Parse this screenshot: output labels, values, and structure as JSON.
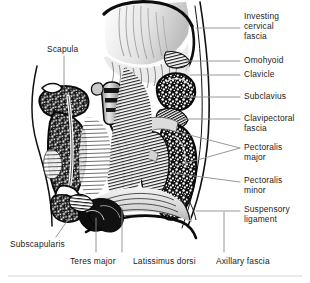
{
  "figure": {
    "title_alt": "Sagittal section of the shoulder region showing the clavipectoral fascia and axilla",
    "colors": {
      "ink": "#111111",
      "label_text": "#1b1b1b",
      "leader_line": "#8d8d8d",
      "outline": "#101010",
      "bone_fill": "#ffffff",
      "muscle_shade": "#d9d9d9",
      "deep_shade": "#4a4a4a",
      "footer_rule": "#d7d7d7",
      "background": "#ffffff"
    }
  },
  "labels": {
    "right_column": [
      {
        "id": "investing-cervical-fascia",
        "text": "Investing\ncervical\nfascia",
        "x": 244,
        "y": 11
      },
      {
        "id": "omohyoid",
        "text": "Omohyoid",
        "x": 244,
        "y": 55
      },
      {
        "id": "clavicle",
        "text": "Clavicle",
        "x": 244,
        "y": 69
      },
      {
        "id": "subclavius",
        "text": "Subclavius",
        "x": 244,
        "y": 91
      },
      {
        "id": "clavipectoral-fascia",
        "text": "Clavipectoral\nfascia",
        "x": 244,
        "y": 113
      },
      {
        "id": "pectoralis-major",
        "text": "Pectoralis\nmajor",
        "x": 244,
        "y": 142
      },
      {
        "id": "pectoralis-minor",
        "text": "Pectoralis\nminor",
        "x": 244,
        "y": 175
      },
      {
        "id": "suspensory-ligament",
        "text": "Suspensory\nligament",
        "x": 244,
        "y": 204
      }
    ],
    "left_column": [
      {
        "id": "scapula",
        "text": "Scapula",
        "x": 47,
        "y": 44
      },
      {
        "id": "subscapularis",
        "text": "Subscapularis",
        "x": 10,
        "y": 239
      }
    ],
    "bottom_row": [
      {
        "id": "teres-major",
        "text": "Teres major",
        "x": 70,
        "y": 256
      },
      {
        "id": "latissimus-dorsi",
        "text": "Latissimus dorsi",
        "x": 133,
        "y": 256
      },
      {
        "id": "axillary-fascia",
        "text": "Axillary fascia",
        "x": 216,
        "y": 256
      }
    ]
  },
  "leader_lines": [
    {
      "id": "leader-investing-cervical-fascia",
      "from": [
        196,
        28
      ],
      "to": [
        240,
        28
      ]
    },
    {
      "id": "leader-omohyoid",
      "from": [
        186,
        61
      ],
      "to": [
        240,
        61
      ]
    },
    {
      "id": "leader-clavicle",
      "from": [
        190,
        75
      ],
      "to": [
        240,
        75
      ]
    },
    {
      "id": "leader-subclavius",
      "from": [
        183,
        97
      ],
      "to": [
        240,
        97
      ]
    },
    {
      "id": "leader-clavipectoral-fascia",
      "from": [
        180,
        119
      ],
      "to": [
        240,
        119
      ]
    },
    {
      "id": "leader-pectoralis-major-upper",
      "from": [
        174,
        131
      ],
      "to": [
        240,
        148
      ]
    },
    {
      "id": "leader-pectoralis-major-lower",
      "from": [
        176,
        166
      ],
      "to": [
        240,
        148
      ]
    },
    {
      "id": "leader-pectoralis-minor",
      "from": [
        172,
        173
      ],
      "to": [
        240,
        182
      ]
    },
    {
      "id": "leader-suspensory-ligament",
      "from": [
        196,
        211
      ],
      "to": [
        240,
        211
      ]
    },
    {
      "id": "leader-scapula",
      "from": [
        64,
        56
      ],
      "to": [
        64,
        88
      ]
    },
    {
      "id": "leader-subscapularis",
      "from": [
        56,
        237
      ],
      "to": [
        72,
        214
      ]
    },
    {
      "id": "leader-teres-major",
      "from": [
        96,
        252
      ],
      "to": [
        96,
        218
      ]
    },
    {
      "id": "leader-latissimus-dorsi",
      "from": [
        122,
        252
      ],
      "to": [
        122,
        208
      ]
    },
    {
      "id": "leader-axillary-fascia",
      "from": [
        224,
        252
      ],
      "to": [
        224,
        212
      ]
    }
  ],
  "footer_rule": {
    "y": 276
  }
}
